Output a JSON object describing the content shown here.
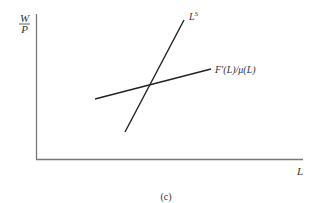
{
  "diagram": {
    "y_axis_label": {
      "numerator": "W",
      "denominator": "P"
    },
    "x_axis_label": "L",
    "curves": [
      {
        "name": "labor-supply",
        "label_main": "L",
        "label_sup": "S",
        "from": [
          125,
          132
        ],
        "to": [
          184,
          20
        ]
      },
      {
        "name": "marginal-product-over-markup",
        "label": "F′(L)/μ(L)",
        "from": [
          95,
          99
        ],
        "to": [
          211,
          69
        ]
      }
    ],
    "caption": "(c)",
    "colors": {
      "axis": "#777777",
      "curve": "#222222",
      "text": "#333333"
    }
  }
}
